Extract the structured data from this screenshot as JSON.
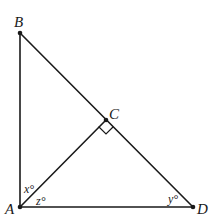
{
  "diagram": {
    "type": "geometry",
    "points": {
      "A": {
        "label": "A",
        "x": 20,
        "y": 207
      },
      "B": {
        "label": "B",
        "x": 20,
        "y": 33
      },
      "C": {
        "label": "C",
        "x": 106,
        "y": 120
      },
      "D": {
        "label": "D",
        "x": 193,
        "y": 207
      }
    },
    "segments": [
      {
        "from": "A",
        "to": "B"
      },
      {
        "from": "B",
        "to": "D"
      },
      {
        "from": "A",
        "to": "D"
      },
      {
        "from": "A",
        "to": "C"
      }
    ],
    "right_angle_at": "C",
    "angles": {
      "x": {
        "label": "x°",
        "vertex": "A",
        "between": [
          "B",
          "C"
        ]
      },
      "z": {
        "label": "z°",
        "vertex": "A",
        "between": [
          "C",
          "D"
        ]
      },
      "y": {
        "label": "y°",
        "vertex": "D",
        "between": [
          "A",
          "B"
        ]
      }
    },
    "colors": {
      "stroke": "#1a1a1a",
      "background": "#ffffff"
    }
  }
}
